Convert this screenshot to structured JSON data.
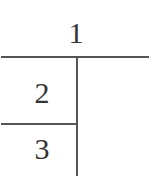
{
  "diagram": {
    "type": "tree-partition",
    "top_label": "1",
    "left_upper_label": "2",
    "left_lower_label": "3",
    "line_color": "#555555",
    "text_color": "#333333"
  }
}
